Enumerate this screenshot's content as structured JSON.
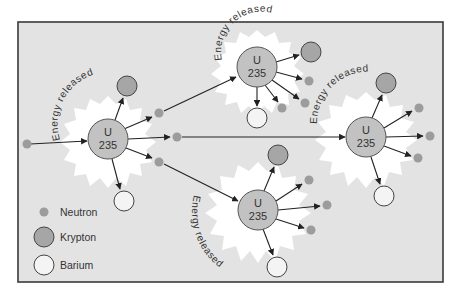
{
  "diagram": {
    "node_label_top": "U",
    "node_label_bottom": "235",
    "energy_label": "Energy released",
    "colors": {
      "background": "#e3e3e3",
      "burst": "#ffffff",
      "uranium": "#c2c2c2",
      "krypton": "#a6a6a6",
      "barium": "#f4f4f4",
      "neutron": "#9c9c9c",
      "arrow": "#222222"
    },
    "incoming_neutron": {
      "x": 27,
      "y": 144
    },
    "reactions": [
      {
        "id": "u1",
        "uranium": {
          "x": 108,
          "y": 139
        },
        "krypton": {
          "x": 127,
          "y": 86
        },
        "barium": {
          "x": 124,
          "y": 201
        },
        "neutrons": [
          {
            "x": 159,
            "y": 113
          },
          {
            "x": 177,
            "y": 137
          },
          {
            "x": 159,
            "y": 162
          }
        ]
      },
      {
        "id": "u2",
        "uranium": {
          "x": 257,
          "y": 67
        },
        "krypton": {
          "x": 311,
          "y": 52
        },
        "barium": {
          "x": 257,
          "y": 118
        },
        "neutrons": [
          {
            "x": 309,
            "y": 81
          },
          {
            "x": 305,
            "y": 103
          },
          {
            "x": 282,
            "y": 108
          }
        ]
      },
      {
        "id": "u3",
        "uranium": {
          "x": 366,
          "y": 137
        },
        "krypton": {
          "x": 386,
          "y": 83
        },
        "barium": {
          "x": 384,
          "y": 196
        },
        "neutrons": [
          {
            "x": 419,
            "y": 108
          },
          {
            "x": 430,
            "y": 136
          },
          {
            "x": 418,
            "y": 158
          }
        ]
      },
      {
        "id": "u4",
        "uranium": {
          "x": 258,
          "y": 210
        },
        "krypton": {
          "x": 278,
          "y": 155
        },
        "barium": {
          "x": 277,
          "y": 267
        },
        "neutrons": [
          {
            "x": 309,
            "y": 180
          },
          {
            "x": 327,
            "y": 205
          },
          {
            "x": 311,
            "y": 230
          }
        ]
      }
    ]
  },
  "legend": {
    "items": [
      {
        "label": "Neutron",
        "symbol": "neutron"
      },
      {
        "label": "Krypton",
        "symbol": "krypton"
      },
      {
        "label": "Barium",
        "symbol": "barium"
      }
    ]
  }
}
